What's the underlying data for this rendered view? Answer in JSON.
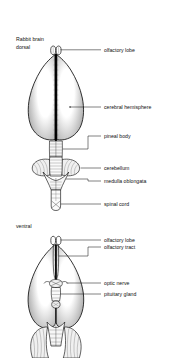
{
  "figure": {
    "title_line1": "Rabbit brain",
    "title_line2": "dorsal",
    "section2_title": "ventral",
    "background": "#ffffff",
    "ink": "#111111"
  },
  "dorsal": {
    "view_label_1": "Rabbit brain",
    "view_label_2": "dorsal",
    "callouts": [
      {
        "id": "olfactory-lobe",
        "text": "olfactory lobe"
      },
      {
        "id": "cerebral-hemisphere",
        "text": "cerebral hemisphere"
      },
      {
        "id": "pineal-body",
        "text": "pineal body"
      },
      {
        "id": "cerebellum",
        "text": "cerebellum"
      },
      {
        "id": "medulla-oblongata",
        "text": "medulla oblongata"
      },
      {
        "id": "spinal-cord",
        "text": "spinal cord"
      }
    ]
  },
  "ventral": {
    "view_label": "ventral",
    "callouts": [
      {
        "id": "olfactory-lobe",
        "text": "olfactory lobe"
      },
      {
        "id": "olfactory-tract",
        "text": "olfactory tract"
      },
      {
        "id": "optic-nerve",
        "text": "optic nerve"
      },
      {
        "id": "pituitary-gland",
        "text": "pituitary gland"
      }
    ]
  }
}
